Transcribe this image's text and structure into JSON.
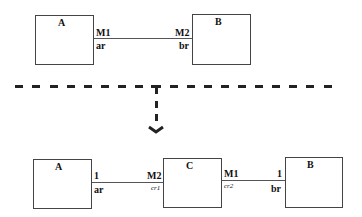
{
  "top_diagram": {
    "box_a": {
      "title": "A"
    },
    "box_b": {
      "title": "B"
    },
    "association": {
      "left_multiplicity": "M1",
      "left_role": "ar",
      "right_multiplicity": "M2",
      "right_role": "br"
    }
  },
  "bottom_diagram": {
    "box_a": {
      "title": "A"
    },
    "box_c": {
      "title": "C"
    },
    "box_b": {
      "title": "B"
    },
    "association_ac": {
      "left_multiplicity": "1",
      "left_role": "ar",
      "right_multiplicity": "M2",
      "right_role": "cr1"
    },
    "association_cb": {
      "left_multiplicity": "M1",
      "left_role": "cr2",
      "right_multiplicity": "1",
      "right_role": "br"
    }
  },
  "separator": {
    "style": "dashed",
    "color": "#222222"
  },
  "transformation_arrow": {
    "direction": "down",
    "style": "dashed"
  }
}
